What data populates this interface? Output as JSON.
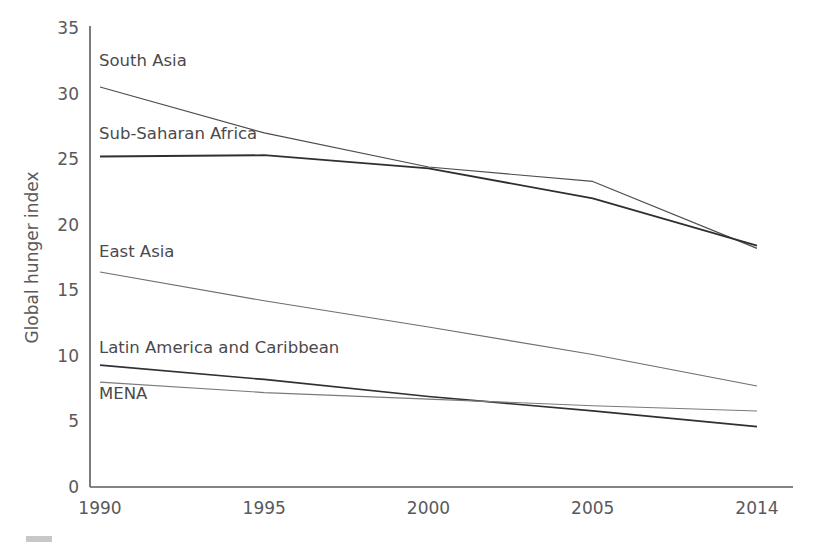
{
  "figure": {
    "width": 822,
    "height": 551,
    "background": "#ffffff",
    "corner_mark_name": "grey-smudge-mark"
  },
  "chart_data": {
    "type": "line",
    "title": "",
    "subtitle": "",
    "xlabel": "",
    "ylabel": "Global hunger index",
    "categories": [
      "1990",
      "1995",
      "2000",
      "2005",
      "2014"
    ],
    "x": [
      1990,
      1995,
      2000,
      2005,
      2014
    ],
    "xlim": [
      1990,
      2014
    ],
    "ylim": [
      0,
      35
    ],
    "yticks": [
      0,
      5,
      10,
      15,
      20,
      25,
      30,
      35
    ],
    "xticks": [
      "1990",
      "1995",
      "2000",
      "2005",
      "2014"
    ],
    "grid": false,
    "legend_position": "inline-labels",
    "series": [
      {
        "name": "South Asia",
        "color": "#4d4d4f",
        "width": 1.2,
        "values": [
          30.5,
          27.0,
          24.4,
          23.3,
          18.2
        ],
        "label_x": 1990,
        "label_y": 32.5
      },
      {
        "name": "Sub-Saharan Africa",
        "color": "#2f2f31",
        "width": 1.8,
        "values": [
          25.2,
          25.3,
          24.3,
          22.0,
          18.4
        ],
        "label_x": 1990,
        "label_y": 26.9
      },
      {
        "name": "East Asia",
        "color": "#6e6e70",
        "width": 1.1,
        "values": [
          16.4,
          14.2,
          12.2,
          10.1,
          7.7
        ],
        "label_x": 1990,
        "label_y": 17.9
      },
      {
        "name": "Latin America and Caribbean",
        "color": "#303032",
        "width": 1.7,
        "values": [
          9.3,
          8.2,
          6.9,
          5.8,
          4.6
        ],
        "label_x": 1990,
        "label_y": 10.6
      },
      {
        "name": "MENA",
        "color": "#7a7a7c",
        "width": 1.1,
        "values": [
          8.0,
          7.2,
          6.7,
          6.2,
          5.8
        ],
        "label_x": 1990,
        "label_y": 7.1
      }
    ],
    "annotations": []
  },
  "axes": {
    "y_axis_name": "y-axis",
    "x_axis_name": "x-axis",
    "axis_color": "#5b5b5b",
    "tick_color": "#59595b"
  }
}
